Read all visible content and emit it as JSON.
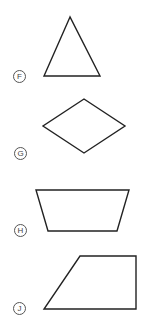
{
  "choices": [
    {
      "letter": "F",
      "shape": "triangle",
      "points": "70,17 44,76 100,76",
      "label_pos": [
        13,
        70
      ]
    },
    {
      "letter": "G",
      "shape": "rhombus",
      "points": "84,99 125,126 84,153 43,126",
      "label_pos": [
        14,
        147
      ]
    },
    {
      "letter": "H",
      "shape": "trapezoid",
      "points": "36,190 129,190 117,231 48,231",
      "label_pos": [
        14,
        224
      ]
    },
    {
      "letter": "J",
      "shape": "trapezoid-right",
      "points": "80,256 136,256 136,309 44,309",
      "label_pos": [
        13,
        302
      ]
    }
  ],
  "colors": {
    "stroke": "#222222",
    "label": "#555555"
  }
}
